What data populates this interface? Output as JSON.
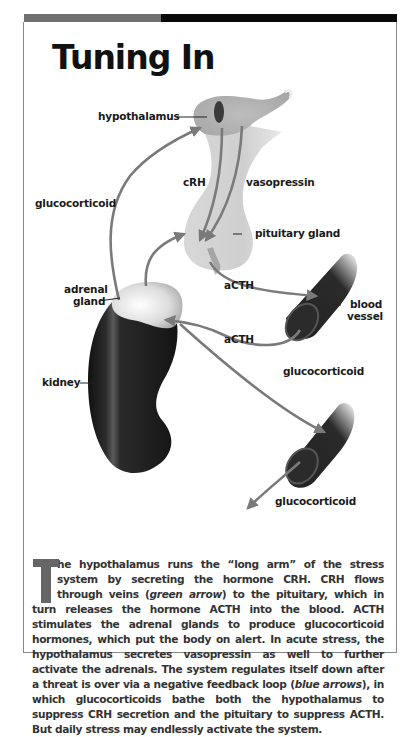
{
  "title": "Tuning In",
  "colors": {
    "top_bar_left": "#707070",
    "top_bar_right": "#0a0a0a",
    "arrow": "#7a7a7a",
    "organ_light": "#c8c8c8",
    "organ_dark": "#1a1a1a",
    "drop_cap": "#666666"
  },
  "diagram": {
    "labels": {
      "hypothalamus": "hypothalamus",
      "crh": "cRH",
      "vasopressin": "vasopressin",
      "glucocorticoid_left": "glucocorticoid",
      "pituitary_gland": "pituitary gland",
      "adrenal_gland_line1": "adrenal",
      "adrenal_gland_line2": "gland",
      "acth_top": "aCTH",
      "acth_bottom": "aCTH",
      "blood_vessel_line1": "blood",
      "blood_vessel_line2": "vessel",
      "kidney": "kidney",
      "glucocorticoid_right": "glucocorticoid",
      "glucocorticoid_bottom": "glucocorticoid"
    }
  },
  "caption": {
    "drop_cap": "T",
    "part1": "he hypothalamus runs the “long arm” of the stress system by secreting the hormone CRH. CRH flows through veins (",
    "italic1": "green arrow",
    "part2": ") to the pituitary, which in turn releases the hormone ACTH into the blood. ACTH stimulates the adrenal glands to produce glucocorticoid hormones, which put the body on alert. In acute stress, the hypothalamus secretes vasopressin as well to further activate the adrenals. The system regulates itself down after a threat is over via a negative feedback loop (",
    "italic2": "blue arrows",
    "part3": "), in which glucocorticoids bathe both the hypothalamus to suppress CRH secretion and the pituitary to suppress ACTH. But daily stress may endlessly activate the system."
  }
}
